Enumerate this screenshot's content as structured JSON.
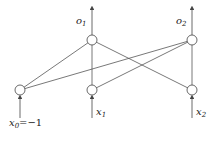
{
  "diagram": {
    "type": "neural-network",
    "inputs": [
      {
        "label": "x",
        "sub": "0",
        "suffix": "=−1"
      },
      {
        "label": "x",
        "sub": "1",
        "suffix": ""
      },
      {
        "label": "x",
        "sub": "2",
        "suffix": ""
      }
    ],
    "outputs": [
      {
        "label": "o",
        "sub": "1"
      },
      {
        "label": "o",
        "sub": "2"
      }
    ],
    "connections": "fully connected: each input node to each output node",
    "colors": {
      "line": "#555555",
      "node_fill": "#ffffff"
    }
  }
}
